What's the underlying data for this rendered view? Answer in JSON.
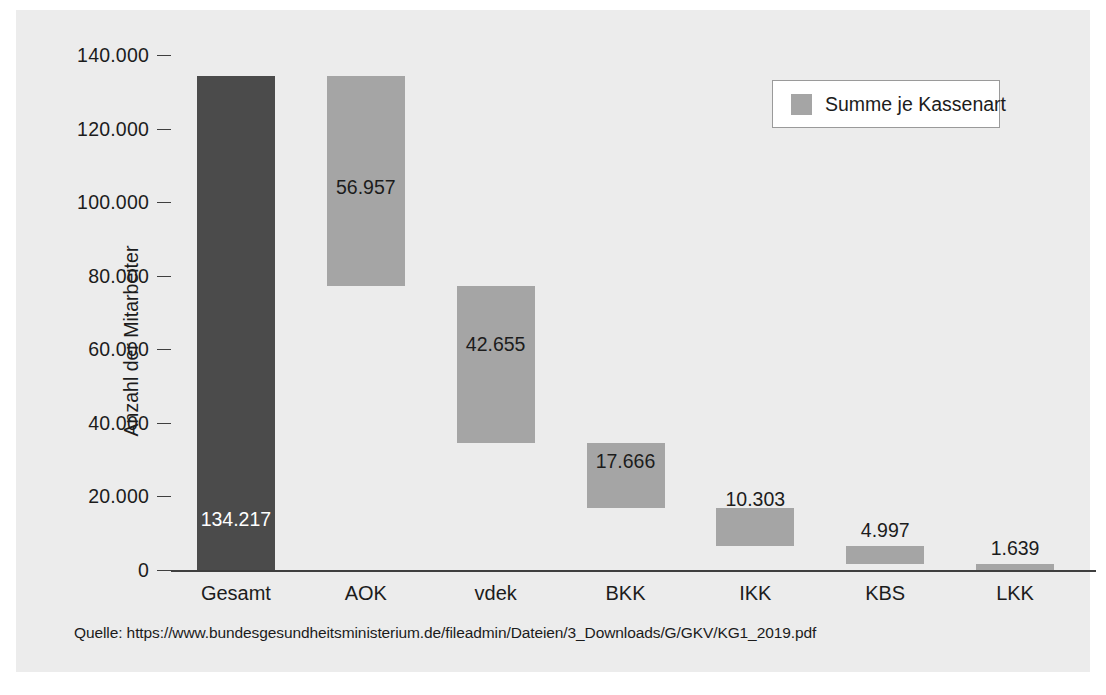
{
  "chart_data": {
    "type": "bar",
    "subtype": "waterfall",
    "title": "",
    "xlabel": "",
    "ylabel": "Anzahl der Mitarbeiter",
    "categories": [
      "Gesamt",
      "AOK",
      "vdek",
      "BKK",
      "IKK",
      "KBS",
      "LKK"
    ],
    "values": [
      134217,
      56957,
      42655,
      17666,
      10303,
      4997,
      1639
    ],
    "value_labels": [
      "134.217",
      "56.957",
      "42.655",
      "17.666",
      "10.303",
      "4.997",
      "1.639"
    ],
    "bar_bottoms": [
      0,
      77260,
      34605,
      16939,
      6636,
      1639,
      0
    ],
    "bar_tops": [
      134217,
      134217,
      77260,
      34605,
      16939,
      6636,
      1639
    ],
    "ylim": [
      0,
      140000
    ],
    "yticks": [
      0,
      20000,
      40000,
      60000,
      80000,
      100000,
      120000,
      140000
    ],
    "ytick_labels": [
      "0",
      "20.000",
      "40.000",
      "60.000",
      "80.000",
      "100.000",
      "120.000",
      "140.000"
    ],
    "grid": false,
    "legend": {
      "position": "top-right",
      "entries": [
        {
          "label": "Summe je Kassenart",
          "color": "#a5a5a5"
        }
      ]
    },
    "colors": {
      "total_bar": "#4b4b4b",
      "segment_bar": "#a5a5a5",
      "plot_background": "#ececec",
      "axis": "#3f3f3f",
      "text": "#1c1c1c",
      "label_on_dark": "#ffffff"
    },
    "label_styles": [
      "inside-dark",
      "inside",
      "inside",
      "inside",
      "inside",
      "above",
      "above"
    ]
  },
  "source": {
    "text": "Quelle: https://www.bundesgesundheitsministerium.de/fileadmin/Dateien/3_Downloads/G/GKV/KG1_2019.pdf"
  }
}
